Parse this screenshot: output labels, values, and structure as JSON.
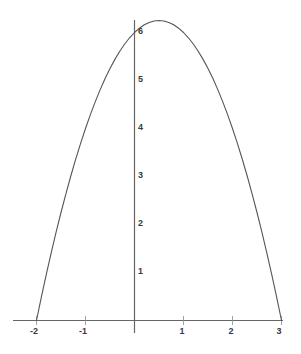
{
  "chart_data": {
    "type": "line",
    "title": "",
    "subtitle": "",
    "xlabel": "",
    "ylabel": "",
    "equation": "y = -(x+2)(x-3) = -x^2 + x + 6",
    "curve_name": "parabola",
    "xlim": [
      -2.25,
      3.1
    ],
    "ylim": [
      -0.35,
      6.6
    ],
    "xticks": [
      -2,
      -1,
      0,
      1,
      2,
      3
    ],
    "yticks": [
      1,
      2,
      3,
      4,
      5,
      6
    ],
    "xtick_labels": [
      "-2",
      "-1",
      "",
      "1",
      "2",
      "3"
    ],
    "ytick_labels": [
      "1",
      "2",
      "3",
      "4",
      "5",
      "6"
    ],
    "grid": false,
    "legend": "none",
    "roots": [
      -2,
      3
    ],
    "vertex": [
      0.5,
      6.25
    ],
    "x": [
      -2,
      -1.9,
      -1.8,
      -1.7,
      -1.6,
      -1.5,
      -1.4,
      -1.3,
      -1.2,
      -1.1,
      -1,
      -0.9,
      -0.8,
      -0.7,
      -0.6,
      -0.5,
      -0.4,
      -0.3,
      -0.2,
      -0.1,
      0,
      0.1,
      0.2,
      0.3,
      0.4,
      0.5,
      0.6,
      0.7,
      0.8,
      0.9,
      1,
      1.1,
      1.2,
      1.3,
      1.4,
      1.5,
      1.6,
      1.7,
      1.8,
      1.9,
      2,
      2.1,
      2.2,
      2.3,
      2.4,
      2.5,
      2.6,
      2.7,
      2.8,
      2.9,
      3
    ],
    "y": [
      0,
      0.49,
      0.96,
      1.41,
      1.84,
      2.25,
      2.64,
      3.01,
      3.36,
      3.69,
      4,
      4.29,
      4.56,
      4.81,
      5.04,
      5.25,
      5.44,
      5.61,
      5.76,
      5.89,
      6,
      6.09,
      6.16,
      6.21,
      6.24,
      6.25,
      6.24,
      6.21,
      6.16,
      6.09,
      6,
      5.89,
      5.76,
      5.61,
      5.44,
      5.25,
      5.04,
      4.81,
      4.56,
      4.29,
      4,
      3.69,
      3.36,
      3.01,
      2.64,
      2.25,
      1.84,
      1.41,
      0.96,
      0.49,
      0
    ],
    "colors": {
      "curve": "#555555",
      "axis": "#666666",
      "tick_label": "#3a3a3a",
      "background": "#ffffff"
    }
  },
  "axes": {
    "x_axis_name": "x-axis",
    "y_axis_name": "y-axis"
  }
}
